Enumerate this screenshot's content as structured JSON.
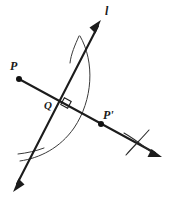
{
  "figure": {
    "background_color": "#ffffff",
    "ink_color": "#1c1c1c",
    "arc_color": "#3a3a3a",
    "width": 172,
    "height": 200
  },
  "labels": {
    "line_l": "l",
    "point_p": "P",
    "point_q": "Q",
    "point_p_prime": "P'"
  },
  "points": [
    {
      "name": "P",
      "label": "P",
      "x": 19,
      "y": 79,
      "label_x": 12,
      "label_y": 68,
      "marker": "filled-dot"
    },
    {
      "name": "Q",
      "label": "Q",
      "x": 64,
      "y": 102,
      "label_x": 45,
      "label_y": 108,
      "marker": "intersection"
    },
    {
      "name": "P'",
      "label": "P'",
      "x": 101,
      "y": 124,
      "label_x": 104,
      "label_y": 118,
      "marker": "filled-dot"
    }
  ],
  "lines": [
    {
      "name": "line-l",
      "label": "l",
      "label_x": 106,
      "label_y": 13,
      "x1": 13,
      "y1": 192,
      "x2": 101,
      "y2": 20,
      "arrows": "both",
      "stroke_width": 2.1
    },
    {
      "name": "segment-p-to-pprime",
      "label": "",
      "x1": 19,
      "y1": 79,
      "x2": 160,
      "y2": 156,
      "arrows": "end",
      "stroke_width": 2.0
    }
  ],
  "arcs": [
    {
      "name": "main-compass-arc",
      "description": "Large arc centered near P passing from upper line crossing down to lower left",
      "path": "M 80 36 C 95 62, 93 100, 74 128 C 60 148, 40 158, 20 161",
      "stroke_width": 1.0
    }
  ],
  "construction_marks": [
    {
      "name": "arc-cross-mark-right",
      "description": "X-shaped intersection of two construction arcs near P prime side",
      "x": 137,
      "y": 142,
      "strokes": [
        {
          "x1": 124,
          "y1": 133,
          "x2": 150,
          "y2": 151
        },
        {
          "x1": 149,
          "y1": 130,
          "x2": 126,
          "y2": 155
        }
      ],
      "stroke_width": 1.0
    },
    {
      "name": "arc-tick-top",
      "description": "Short arc tick crossing line l near the top",
      "strokes": [
        {
          "x1": 79,
          "y1": 36,
          "x2": 70,
          "y2": 63
        }
      ],
      "stroke_width": 1.0
    },
    {
      "name": "arc-tick-bottom-left",
      "description": "Short arc tick crossing line l near the bottom left",
      "strokes": [
        {
          "x1": 18,
          "y1": 154,
          "x2": 44,
          "y2": 148
        }
      ],
      "stroke_width": 1.0
    }
  ],
  "angle_markers": [
    {
      "name": "right-angle-at-q",
      "description": "Square marker indicating perpendicularity at Q",
      "vertex_x": 67,
      "vertex_y": 104,
      "size": 8,
      "value": "90"
    }
  ]
}
